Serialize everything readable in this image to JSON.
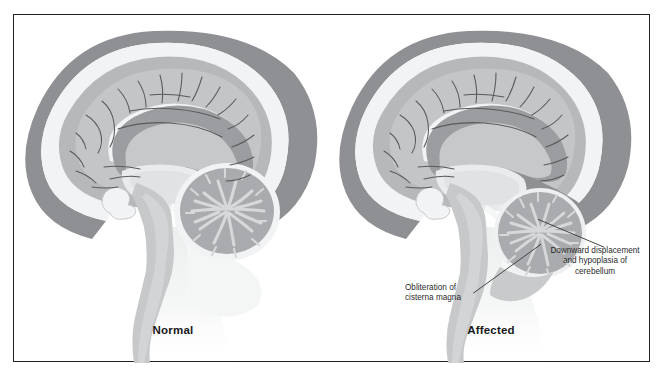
{
  "figure": {
    "type": "medical-illustration",
    "border_color": "#231f20",
    "background_color": "#ffffff"
  },
  "panels": [
    {
      "id": "normal",
      "caption": "Normal",
      "annotations": []
    },
    {
      "id": "affected",
      "caption": "Affected",
      "annotations": [
        {
          "id": "cerebellum",
          "text": "Downward displacement\nand hypoplasia of\ncerebellum",
          "align": "center",
          "leader": {
            "x1": 528,
            "y1": 217,
            "x2": 592,
            "y2": 244
          }
        },
        {
          "id": "cisterna",
          "text": "Obliteration of\ncisterna magna",
          "align": "left",
          "leader": {
            "x1": 531,
            "y1": 241,
            "x2": 466,
            "y2": 288
          }
        }
      ]
    }
  ],
  "palette": {
    "skull_dura": "#8e9093",
    "skull_dura_light": "#a7a9ac",
    "csf_white": "#f2f3f4",
    "cortex_gray": "#b6b8ba",
    "cortex_gray_dark": "#a2a4a7",
    "white_matter": "#d4d6d7",
    "deep_structure": "#c9cbcc",
    "ventricle": "#e9eaeb",
    "cerebellum_body": "#a9abae",
    "arbor_vitae": "#d6d8d9",
    "sulcus_line": "#5a5a5c",
    "brainstem": "#c6c8c9",
    "cord_fade": "#dfe0e1",
    "leader_line": "#3c3c3e",
    "text": "#2b2b2d",
    "caption_text": "#18181a"
  },
  "icons": {
    "leader_line": "leader-line-icon"
  }
}
